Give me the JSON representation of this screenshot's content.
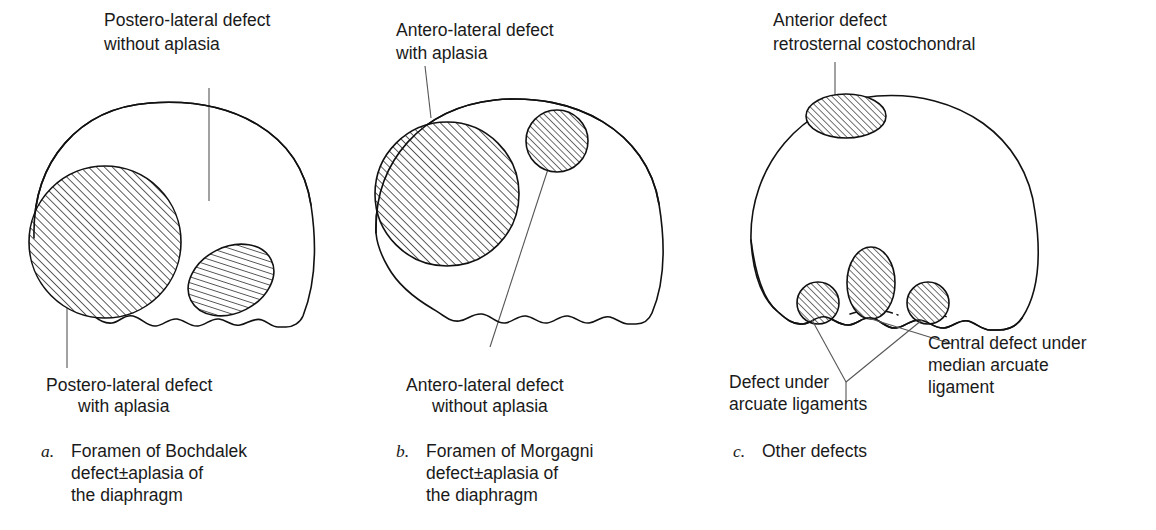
{
  "figure": {
    "background_color": "#ffffff",
    "ink_color": "#111111",
    "leader_color": "#555555"
  },
  "panels": [
    {
      "id": "a",
      "letter": "a.",
      "caption_lines": [
        "Foramen of Bochdalek",
        "defect±aplasia of",
        "the diaphragm"
      ],
      "labels": [
        {
          "name": "postero-lateral-without-aplasia",
          "lines": [
            "Postero-lateral defect",
            "without aplasia"
          ],
          "align": "start"
        },
        {
          "name": "postero-lateral-with-aplasia",
          "lines": [
            "Postero-lateral defect",
            "with aplasia"
          ],
          "align": "start"
        }
      ],
      "lesions": [
        {
          "name": "large-postero-lateral-defect",
          "shape": "circle",
          "hatched": true
        },
        {
          "name": "small-postero-lateral-defect",
          "shape": "ellipse",
          "hatched": true
        }
      ]
    },
    {
      "id": "b",
      "letter": "b.",
      "caption_lines": [
        "Foramen of Morgagni",
        "defect±aplasia of",
        "the diaphragm"
      ],
      "labels": [
        {
          "name": "antero-lateral-with-aplasia",
          "lines": [
            "Antero-lateral defect",
            "with aplasia"
          ],
          "align": "start"
        },
        {
          "name": "antero-lateral-without-aplasia",
          "lines": [
            "Antero-lateral defect",
            "without aplasia"
          ],
          "align": "start"
        }
      ],
      "lesions": [
        {
          "name": "large-antero-lateral-defect",
          "shape": "circle",
          "hatched": true
        },
        {
          "name": "small-antero-lateral-defect",
          "shape": "circle",
          "hatched": true
        }
      ]
    },
    {
      "id": "c",
      "letter": "c.",
      "caption_lines": [
        "Other defects"
      ],
      "labels": [
        {
          "name": "anterior-retrosternal-costochondral",
          "lines": [
            "Anterior defect",
            "retrosternal costochondral"
          ],
          "align": "start"
        },
        {
          "name": "defect-under-arcuate-ligaments",
          "lines": [
            "Defect under",
            "arcuate ligaments"
          ],
          "align": "start"
        },
        {
          "name": "central-defect-median-arcuate-ligament",
          "lines": [
            "Central defect under",
            "median arcuate",
            "ligament"
          ],
          "align": "start"
        }
      ],
      "lesions": [
        {
          "name": "anterior-retrosternal-defect",
          "shape": "ellipse",
          "hatched": true
        },
        {
          "name": "left-arcuate-ligament-defect",
          "shape": "circle",
          "hatched": true
        },
        {
          "name": "central-median-arcuate-defect",
          "shape": "ellipse",
          "hatched": true
        },
        {
          "name": "right-arcuate-ligament-defect",
          "shape": "circle",
          "hatched": true
        }
      ]
    }
  ],
  "text": {
    "a_label1_line1": "Postero-lateral defect",
    "a_label1_line2": "without aplasia",
    "a_label2_line1": "Postero-lateral defect",
    "a_label2_line2": "with aplasia",
    "a_letter": "a.",
    "a_cap1": "Foramen of Bochdalek",
    "a_cap2": "defect±aplasia of",
    "a_cap3": "the diaphragm",
    "b_label1_line1": "Antero-lateral defect",
    "b_label1_line2": "with aplasia",
    "b_label2_line1": "Antero-lateral defect",
    "b_label2_line2": "without aplasia",
    "b_letter": "b.",
    "b_cap1": "Foramen of Morgagni",
    "b_cap2": "defect±aplasia of",
    "b_cap3": "the diaphragm",
    "c_label1_line1": "Anterior defect",
    "c_label1_line2": "retrosternal costochondral",
    "c_label2_line1": "Defect under",
    "c_label2_line2": "arcuate ligaments",
    "c_label3_line1": "Central defect under",
    "c_label3_line2": "median arcuate",
    "c_label3_line3": "ligament",
    "c_letter": "c.",
    "c_cap1": "Other defects"
  }
}
